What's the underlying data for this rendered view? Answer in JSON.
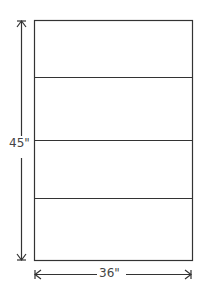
{
  "diagram": {
    "height_label": "45\"",
    "width_label": "36\"",
    "panels": 4,
    "stroke_color": "#333333"
  }
}
